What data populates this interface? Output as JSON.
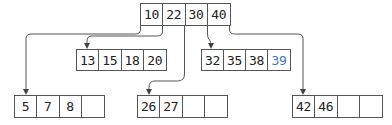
{
  "diagram": {
    "type": "B-tree",
    "colors": {
      "line": "#555555",
      "text": "#222222",
      "highlight": "#3b78b8"
    },
    "root": {
      "keys": [
        "10",
        "22",
        "30",
        "40"
      ]
    },
    "internal_children": [
      {
        "id": "child-13",
        "keys": [
          "13",
          "15",
          "18",
          "20"
        ],
        "highlight_index": null
      },
      {
        "id": "child-32",
        "keys": [
          "32",
          "35",
          "38",
          "39"
        ],
        "highlight_index": 3
      }
    ],
    "leaves": [
      {
        "id": "leaf-5",
        "keys": [
          "5",
          "7",
          "8",
          ""
        ]
      },
      {
        "id": "leaf-26",
        "keys": [
          "26",
          "27",
          "",
          ""
        ]
      },
      {
        "id": "leaf-42",
        "keys": [
          "42",
          "46",
          "",
          ""
        ]
      }
    ]
  }
}
